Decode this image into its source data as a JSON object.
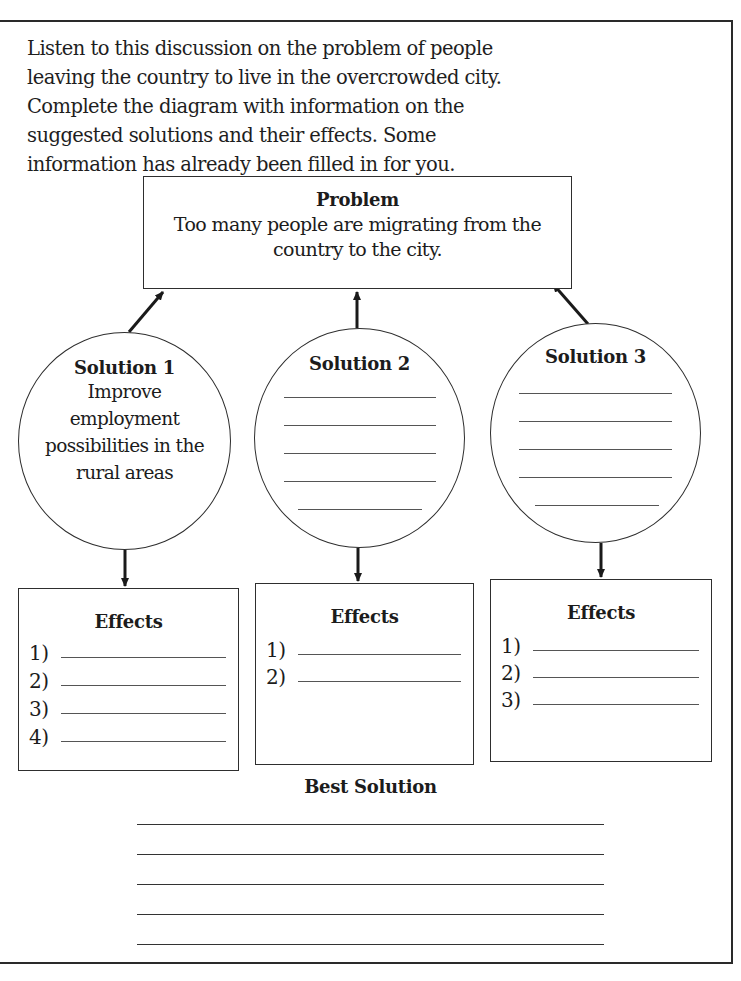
{
  "instructions": "Listen to this discussion on the problem of people leaving the country to live in the overcrowded city. Complete the diagram with information on the suggested solutions and their effects. Some information has already been filled in for you.",
  "problem": {
    "title": "Problem",
    "text": "Too many people are migrating from the country to the city."
  },
  "solutions": [
    {
      "title": "Solution 1",
      "text": "Improve employment possibilities in the rural areas",
      "blank_lines": 0
    },
    {
      "title": "Solution 2",
      "text": "",
      "blank_lines": 5
    },
    {
      "title": "Solution 3",
      "text": "",
      "blank_lines": 5
    }
  ],
  "effects": [
    {
      "title": "Effects",
      "items": [
        "1)",
        "2)",
        "3)",
        "4)"
      ]
    },
    {
      "title": "Effects",
      "items": [
        "1)",
        "2)"
      ]
    },
    {
      "title": "Effects",
      "items": [
        "1)",
        "2)",
        "3)"
      ]
    }
  ],
  "best_solution": {
    "title": "Best Solution",
    "blank_lines": 5
  },
  "colors": {
    "ink": "#1c1c1c",
    "line": "#555555",
    "paper": "#ffffff"
  }
}
